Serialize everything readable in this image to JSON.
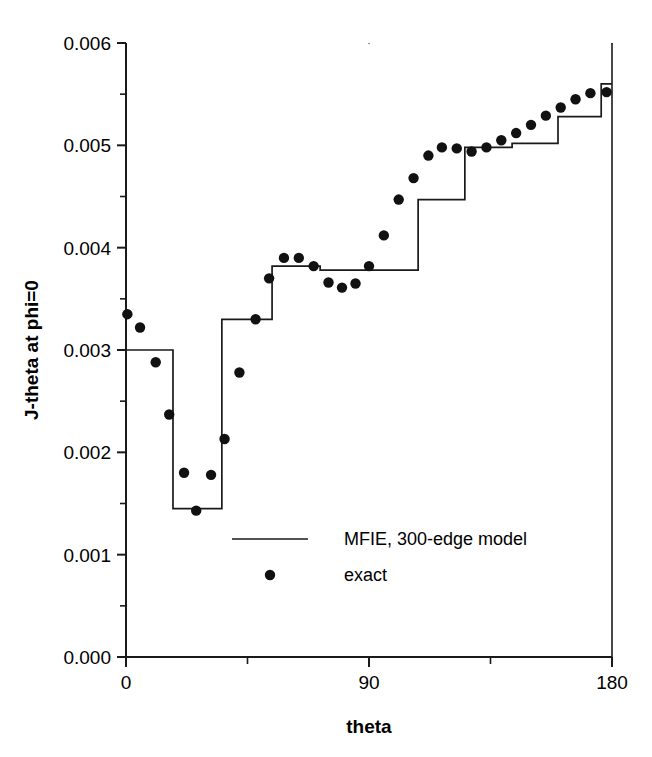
{
  "chart_data": {
    "type": "line",
    "title": "",
    "xlabel": "theta",
    "ylabel": "J-theta at phi=0",
    "xlim": [
      0,
      180
    ],
    "ylim": [
      0.0,
      0.006
    ],
    "grid": false,
    "legend_position": "inside-bottom-center",
    "x_ticks_major": [
      0,
      90,
      180
    ],
    "x_tick_labels": [
      "0",
      "90",
      "180"
    ],
    "x_ticks_minor": [
      45,
      135
    ],
    "y_ticks_major": [
      0.0,
      0.001,
      0.002,
      0.003,
      0.004,
      0.005,
      0.006
    ],
    "y_tick_labels": [
      "0.000",
      "0.001",
      "0.002",
      "0.003",
      "0.004",
      "0.005",
      "0.006"
    ],
    "y_ticks_minor": [
      0.0005,
      0.0015,
      0.0025,
      0.0035,
      0.0045,
      0.0055
    ],
    "series": [
      {
        "name": "MFIE, 300-edge model",
        "style": "step",
        "marker": "none",
        "color": "#1a1a1a",
        "steps": [
          {
            "x_start": 0,
            "x_end": 17.4,
            "y": 0.003
          },
          {
            "x_start": 17.4,
            "x_end": 35.5,
            "y": 0.00145
          },
          {
            "x_start": 35.5,
            "x_end": 54.1,
            "y": 0.0033
          },
          {
            "x_start": 54.1,
            "x_end": 71.9,
            "y": 0.00382
          },
          {
            "x_start": 71.9,
            "x_end": 108.2,
            "y": 0.00378
          },
          {
            "x_start": 108.2,
            "x_end": 125.5,
            "y": 0.00447
          },
          {
            "x_start": 125.5,
            "x_end": 143.0,
            "y": 0.00498
          },
          {
            "x_start": 143.0,
            "x_end": 160.0,
            "y": 0.00502
          },
          {
            "x_start": 160.0,
            "x_end": 176.0,
            "y": 0.00528
          },
          {
            "x_start": 176.0,
            "x_end": 180.0,
            "y": 0.0056
          }
        ]
      },
      {
        "name": "exact",
        "style": "scatter",
        "marker": "circle",
        "color": "#111111",
        "points": [
          [
            0.5,
            0.00335
          ],
          [
            5.2,
            0.00322
          ],
          [
            11.0,
            0.00288
          ],
          [
            16.0,
            0.00237
          ],
          [
            21.5,
            0.0018
          ],
          [
            26.0,
            0.00143
          ],
          [
            31.5,
            0.00178
          ],
          [
            36.5,
            0.00213
          ],
          [
            42.0,
            0.00278
          ],
          [
            48.0,
            0.0033
          ],
          [
            53.0,
            0.0037
          ],
          [
            58.5,
            0.0039
          ],
          [
            64.0,
            0.0039
          ],
          [
            69.5,
            0.00382
          ],
          [
            75.0,
            0.00366
          ],
          [
            80.0,
            0.00361
          ],
          [
            85.0,
            0.00365
          ],
          [
            90.0,
            0.00382
          ],
          [
            95.5,
            0.00412
          ],
          [
            101.0,
            0.00447
          ],
          [
            106.5,
            0.00468
          ],
          [
            112.0,
            0.0049
          ],
          [
            117.0,
            0.00498
          ],
          [
            122.5,
            0.00497
          ],
          [
            128.0,
            0.00494
          ],
          [
            133.5,
            0.00498
          ],
          [
            139.0,
            0.00505
          ],
          [
            144.5,
            0.00512
          ],
          [
            150.0,
            0.0052
          ],
          [
            155.5,
            0.00529
          ],
          [
            161.0,
            0.00537
          ],
          [
            166.5,
            0.00545
          ],
          [
            172.0,
            0.00551
          ],
          [
            178.0,
            0.00552
          ]
        ]
      }
    ],
    "legend_entries": [
      {
        "label": "MFIE, 300-edge model",
        "symbol": "line"
      },
      {
        "label": "exact",
        "symbol": "dot"
      }
    ]
  }
}
